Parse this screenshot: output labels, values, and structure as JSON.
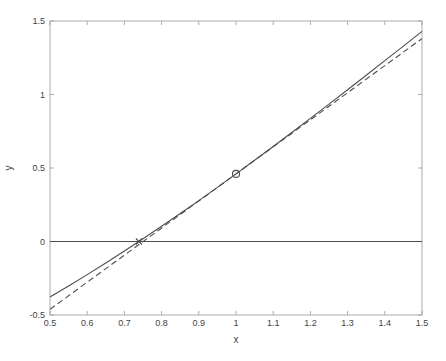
{
  "figure": {
    "background": "#ffffff"
  },
  "chart_data": {
    "type": "line",
    "title": "",
    "xlabel": "x",
    "ylabel": "y",
    "xlim": [
      0.5,
      1.5
    ],
    "ylim": [
      -0.5,
      1.5
    ],
    "grid": false,
    "box": true,
    "legend": "none",
    "axis_color": "#ababab",
    "label_color": "#3f3f3f",
    "line_color": "#4d4d4d",
    "xticks": {
      "values": [
        0.5,
        0.6,
        0.7,
        0.8,
        0.9,
        1.0,
        1.1,
        1.2,
        1.3,
        1.4,
        1.5
      ],
      "labels": [
        "0.5",
        "0.6",
        "0.7",
        "0.8",
        "0.9",
        "1",
        "1.1",
        "1.2",
        "1.3",
        "1.4",
        "1.5"
      ]
    },
    "yticks": {
      "values": [
        -0.5,
        0,
        0.5,
        1.0,
        1.5
      ],
      "labels": [
        "-0.5",
        "0",
        "0.5",
        "1",
        "1.5"
      ]
    },
    "series": [
      {
        "name": "curve-f-x-minus-cos-x",
        "style": "solid",
        "x": [
          0.5,
          0.55,
          0.6,
          0.65,
          0.7,
          0.75,
          0.8,
          0.85,
          0.9,
          0.95,
          1.0,
          1.05,
          1.1,
          1.15,
          1.2,
          1.25,
          1.3,
          1.35,
          1.4,
          1.45,
          1.5
        ],
        "y": [
          -0.3776,
          -0.3025,
          -0.2253,
          -0.1461,
          -0.0648,
          0.0183,
          0.1033,
          0.19,
          0.2784,
          0.3683,
          0.4597,
          0.5524,
          0.6464,
          0.7415,
          0.8376,
          0.9347,
          1.0325,
          1.131,
          1.23,
          1.3295,
          1.4293
        ]
      },
      {
        "name": "tangent-line-at-x-1",
        "style": "dashed",
        "x": [
          0.5,
          1.5
        ],
        "y": [
          -0.461,
          1.3804
        ]
      },
      {
        "name": "zero-horizontal-line",
        "style": "solid",
        "x": [
          0.5,
          1.5
        ],
        "y": [
          0,
          0
        ]
      }
    ],
    "markers": [
      {
        "shape": "circle",
        "x": 1.0,
        "y": 0.4597
      },
      {
        "shape": "x",
        "x": 0.7391,
        "y": 0
      }
    ]
  }
}
